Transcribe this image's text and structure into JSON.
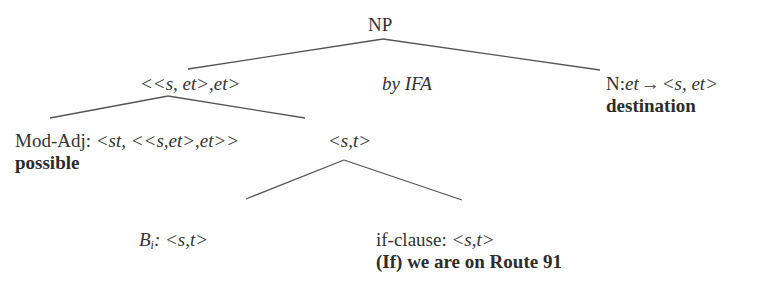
{
  "tree": {
    "root": {
      "label": "NP"
    },
    "left_node": {
      "type_label": "<<s, et>,et>"
    },
    "middle_annotation": {
      "label": "by IFA"
    },
    "right_node": {
      "label_prefix": "N:",
      "type_from": "et",
      "arrow": "→",
      "type_to": "<s, et>",
      "word": "destination"
    },
    "mod_adj_node": {
      "label_prefix": "Mod-Adj: ",
      "type_label": "<st, <<s,et>,et>>",
      "word": "possible"
    },
    "st_node": {
      "type_label": "<s,t>"
    },
    "bi_node": {
      "label_base": "B",
      "label_sub": "i",
      "type_label": ": <s,t>"
    },
    "if_clause_node": {
      "label_prefix": "if-clause: ",
      "type_label": "<s,t>",
      "words": "(If) we are on Route 91"
    }
  },
  "edges": [
    {
      "from": "NP",
      "to": "<<s, et>,et>"
    },
    {
      "from": "NP",
      "to": "N:et→<s, et>"
    },
    {
      "from": "<<s, et>,et>",
      "to": "Mod-Adj"
    },
    {
      "from": "<<s, et>,et>",
      "to": "<s,t>"
    },
    {
      "from": "<s,t>",
      "to": "B_i"
    },
    {
      "from": "<s,t>",
      "to": "if-clause"
    }
  ]
}
